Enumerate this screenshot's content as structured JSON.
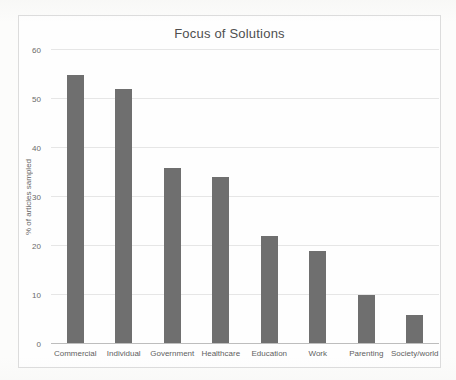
{
  "chart_data": {
    "type": "bar",
    "title": "Focus of Solutions",
    "xlabel": "",
    "ylabel": "% of articles sampled",
    "categories": [
      "Commercial",
      "Individual",
      "Government",
      "Healthcare",
      "Education",
      "Work",
      "Parenting",
      "Society/world"
    ],
    "values": [
      55,
      52,
      36,
      34,
      22,
      19,
      10,
      6
    ],
    "ylim": [
      0,
      60
    ],
    "yticks": [
      0,
      10,
      20,
      30,
      40,
      50,
      60
    ],
    "grid": "horizontal",
    "legend": "none",
    "colors": {
      "bar": "#6f6f6f",
      "gridline": "#e6e6e6",
      "axis_line": "#bdbdbd",
      "text": "#595959",
      "frame_border": "#dcdcdc",
      "background": "#fefefe"
    }
  }
}
